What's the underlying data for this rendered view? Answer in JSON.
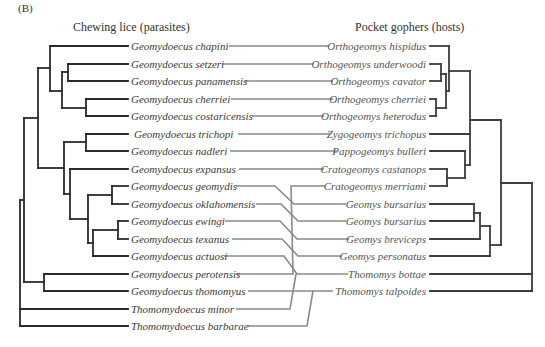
{
  "figure": {
    "panel_label": "(B)",
    "left_title": "Chewing lice (parasites)",
    "right_title": "Pocket gophers (hosts)"
  },
  "colors": {
    "parasite_tree": "#2b2b2b",
    "host_tree": "#3c3c44",
    "association_lines": "#8a8a8a",
    "text": "#333333"
  },
  "parasites": [
    "Geomydoecus chapini",
    "Geomydoecus setzeri",
    "Geomydoecus panamensis",
    "Geomydoecus cherriei",
    "Geomydoecus costaricensis",
    "Geomydoecus trichopi",
    "Geomydoecus nadleri",
    "Geomydoecus expansus",
    "Geomydoecus geomydis",
    "Geomydoecus oklahomensis",
    "Geomydoecus ewingi",
    "Geomydoecus texanus",
    "Geomydoecus actuosi",
    "Geomydoecus perotensis",
    "Geomydoecus thomomyus",
    "Thomomydoecus minor",
    "Thomomydoecus barbarae"
  ],
  "hosts": [
    "Orthogeomys hispidus",
    "Orthogeomys underwoodi",
    "Orthogeomys cavator",
    "Orthogeomys cherriei",
    "Orthogeomys heterodus",
    "Zygogeomys trichopus",
    "Pappogeomys bulleri",
    "Cratogeomys castanops",
    "Cratogeomys merriami",
    "Geomys bursarius",
    "Geomys bursarius",
    "Geomys breviceps",
    "Geomys personatus",
    "Thomomys bottae",
    "Thomomys talpoides"
  ],
  "associations": [
    {
      "parasite": "Geomydoecus chapini",
      "host": "Orthogeomys hispidus"
    },
    {
      "parasite": "Geomydoecus setzeri",
      "host": "Orthogeomys underwoodi"
    },
    {
      "parasite": "Geomydoecus panamensis",
      "host": "Orthogeomys cavator"
    },
    {
      "parasite": "Geomydoecus cherriei",
      "host": "Orthogeomys cherriei"
    },
    {
      "parasite": "Geomydoecus costaricensis",
      "host": "Orthogeomys heterodus"
    },
    {
      "parasite": "Geomydoecus trichopi",
      "host": "Zygogeomys trichopus"
    },
    {
      "parasite": "Geomydoecus nadleri",
      "host": "Pappogeomys bulleri"
    },
    {
      "parasite": "Geomydoecus expansus",
      "host": "Cratogeomys castanops"
    },
    {
      "parasite": "Geomydoecus geomydis",
      "host": "Geomys bursarius"
    },
    {
      "parasite": "Geomydoecus oklahomensis",
      "host": "Geomys bursarius"
    },
    {
      "parasite": "Geomydoecus ewingi",
      "host": "Geomys breviceps"
    },
    {
      "parasite": "Geomydoecus texanus",
      "host": "Geomys personatus"
    },
    {
      "parasite": "Geomydoecus actuosi",
      "host": "Thomomys bottae"
    },
    {
      "parasite": "Geomydoecus perotensis",
      "host": "Cratogeomys merriami"
    },
    {
      "parasite": "Geomydoecus thomomyus",
      "host": "Thomomys talpoides"
    },
    {
      "parasite": "Thomomydoecus minor",
      "host": "Thomomys bottae"
    },
    {
      "parasite": "Thomomydoecus barbarae",
      "host": "Thomomys talpoides"
    }
  ]
}
